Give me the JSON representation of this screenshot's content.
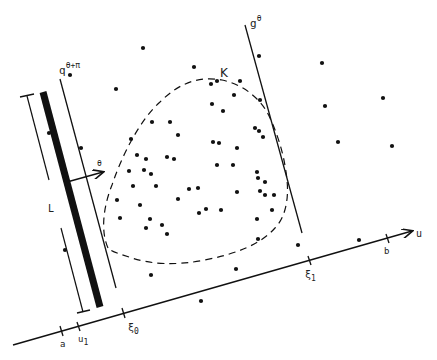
{
  "diagram": {
    "colors": {
      "ink": "#111111",
      "background": "#ffffff"
    },
    "labels": {
      "K": "K",
      "g_theta_base": "g",
      "g_theta_sup": "θ",
      "q_base": "q",
      "q_sup": "θ+π",
      "theta_arrow": "θ",
      "L": "L",
      "u_axis": "u",
      "a": "a",
      "u1_base": "u",
      "u1_sub": "1",
      "xi0_base": "ξ",
      "xi0_sub": "0",
      "xi1_base": "ξ",
      "xi1_sub": "1",
      "b": "b"
    },
    "elements": {
      "convex_set": "K (dashed outline)",
      "support_line_g": "g^θ",
      "support_line_q": "q^(θ+π)",
      "thick_strip": "strip of width",
      "length_bracket": "L",
      "direction_arrow": "θ",
      "axis": "u"
    },
    "points": [
      [
        143,
        48
      ],
      [
        116,
        89
      ],
      [
        70,
        75
      ],
      [
        49,
        133
      ],
      [
        65,
        250
      ],
      [
        81,
        148
      ],
      [
        194,
        67
      ],
      [
        211,
        84
      ],
      [
        217,
        81
      ],
      [
        223,
        111
      ],
      [
        212,
        104
      ],
      [
        131,
        139
      ],
      [
        152,
        122
      ],
      [
        170,
        122
      ],
      [
        178,
        135
      ],
      [
        137,
        155
      ],
      [
        144,
        170
      ],
      [
        151,
        174
      ],
      [
        146,
        159
      ],
      [
        167,
        157
      ],
      [
        174,
        159
      ],
      [
        129,
        171
      ],
      [
        117,
        200
      ],
      [
        133,
        186
      ],
      [
        156,
        186
      ],
      [
        178,
        199
      ],
      [
        189,
        189
      ],
      [
        150,
        219
      ],
      [
        146,
        228
      ],
      [
        162,
        225
      ],
      [
        167,
        234
      ],
      [
        240,
        81
      ],
      [
        234,
        95
      ],
      [
        260,
        100
      ],
      [
        255,
        128
      ],
      [
        259,
        131
      ],
      [
        263,
        137
      ],
      [
        219,
        143
      ],
      [
        213,
        142
      ],
      [
        217,
        165
      ],
      [
        233,
        165
      ],
      [
        237,
        148
      ],
      [
        198,
        188
      ],
      [
        206,
        209
      ],
      [
        199,
        213
      ],
      [
        221,
        210
      ],
      [
        237,
        192
      ],
      [
        257,
        172
      ],
      [
        258,
        178
      ],
      [
        265,
        182
      ],
      [
        260,
        191
      ],
      [
        265,
        195
      ],
      [
        274,
        195
      ],
      [
        272,
        210
      ],
      [
        257,
        219
      ],
      [
        258,
        239
      ],
      [
        298,
        245
      ],
      [
        259,
        56
      ],
      [
        322,
        63
      ],
      [
        325,
        106
      ],
      [
        383,
        98
      ],
      [
        338,
        142
      ],
      [
        392,
        146
      ],
      [
        359,
        240
      ],
      [
        236,
        269
      ],
      [
        151,
        275
      ],
      [
        201,
        301
      ],
      [
        140,
        205
      ],
      [
        120,
        218
      ]
    ]
  }
}
